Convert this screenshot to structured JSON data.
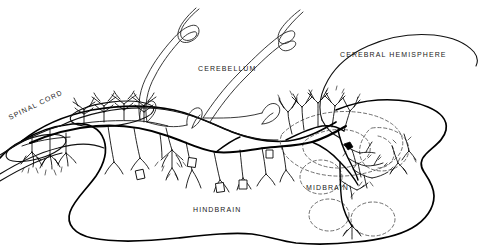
{
  "figure": {
    "type": "anatomical-line-drawing",
    "background_color": "#ffffff",
    "ink_color": "#000000",
    "dashed_nucleus_color": "#555555"
  },
  "labels": {
    "spinal_cord": "SPINAL CORD",
    "cerebellum": "CEREBELLUM",
    "cerebral_hemisphere": "CEREBRAL HEMISPHERE",
    "hindbrain": "HINDBRAIN",
    "midbrain": "MIDBRAIN"
  },
  "label_positions": {
    "spinal_cord": {
      "x": 10,
      "y": 120,
      "rotation": -26
    },
    "cerebellum": {
      "x": 198,
      "y": 71
    },
    "cerebral_hemisphere": {
      "x": 340,
      "y": 57
    },
    "hindbrain": {
      "x": 193,
      "y": 212
    },
    "midbrain": {
      "x": 306,
      "y": 190
    }
  },
  "regions": [
    {
      "name": "spinal-cord",
      "description": "Tapering cord entering from lower left with parallel walls"
    },
    {
      "name": "hindbrain",
      "description": "Large elongated body occupying the lower-left and centre"
    },
    {
      "name": "cerebellum",
      "description": "Folded ribbon drawn as a double outline above the hindbrain"
    },
    {
      "name": "midbrain",
      "description": "Right portion containing dashed nuclei outlines"
    },
    {
      "name": "cerebral-hemisphere",
      "description": "Large rounded mass in the upper right"
    }
  ],
  "neural_features": [
    {
      "name": "main-longitudinal-tract",
      "description": "Heavy axon running from spinal cord to midbrain"
    },
    {
      "name": "cerebellar-purkinje-arbors",
      "description": "Branching dendritic trees in the upper-left oval"
    },
    {
      "name": "midbrain-arborization",
      "description": "Dense dark dendritic plexus in the midbrain tectum"
    },
    {
      "name": "descending-collaterals",
      "description": "Axon collaterals descending into the hindbrain"
    },
    {
      "name": "cell-bodies",
      "description": "Small polygonal somata along the collaterals"
    }
  ]
}
